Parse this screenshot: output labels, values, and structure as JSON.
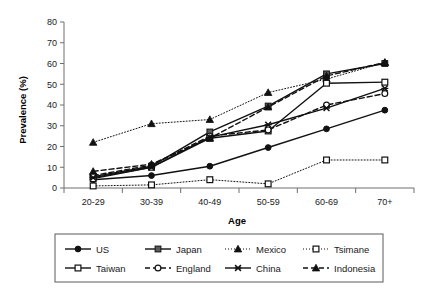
{
  "chart_data": {
    "type": "line",
    "title": "",
    "xlabel": "Age",
    "ylabel": "Prevalence (%)",
    "categories": [
      "20-29",
      "30-39",
      "40-49",
      "50-59",
      "60-69",
      "70+"
    ],
    "ylim": [
      0,
      80
    ],
    "yticks": [
      0,
      10,
      20,
      30,
      40,
      50,
      60,
      70,
      80
    ],
    "grid": false,
    "legend_position": "bottom",
    "series": [
      {
        "name": "US",
        "values": [
          4,
          6,
          10.5,
          19.5,
          28.5,
          37.5
        ],
        "marker": "filled-circle",
        "line": "solid"
      },
      {
        "name": "Japan",
        "values": [
          5.5,
          10.5,
          27,
          39.5,
          55,
          60
        ],
        "marker": "filled-square",
        "line": "solid"
      },
      {
        "name": "Mexico",
        "values": [
          22,
          31,
          33,
          46,
          52.5,
          60.5
        ],
        "marker": "filled-triangle",
        "line": "dotted"
      },
      {
        "name": "Tsimane",
        "values": [
          1,
          1.5,
          4,
          2,
          13.5,
          13.5
        ],
        "marker": "open-square",
        "line": "dotted"
      },
      {
        "name": "Taiwan",
        "values": [
          4.5,
          10,
          24,
          27.5,
          50.5,
          51
        ],
        "marker": "open-square",
        "line": "solid"
      },
      {
        "name": "England",
        "values": [
          6,
          11,
          25,
          28,
          40,
          45.5
        ],
        "marker": "open-circle",
        "line": "dashed"
      },
      {
        "name": "China",
        "values": [
          5,
          10,
          24.5,
          30.5,
          38.5,
          48
        ],
        "marker": "cross-x",
        "line": "solid"
      },
      {
        "name": "Indonesia",
        "values": [
          8,
          11.5,
          24,
          39,
          54,
          60.5
        ],
        "marker": "filled-triangle",
        "line": "dashed"
      }
    ]
  },
  "legend": {
    "entries": [
      {
        "label": "US"
      },
      {
        "label": "Japan"
      },
      {
        "label": "Mexico"
      },
      {
        "label": "Tsimane"
      },
      {
        "label": "Taiwan"
      },
      {
        "label": "England"
      },
      {
        "label": "China"
      },
      {
        "label": "Indonesia"
      }
    ]
  },
  "colors": {
    "line": "#111111",
    "axis": "#6e6e6e",
    "text": "#1a1a1a",
    "japan_marker": "#595959",
    "background": "#ffffff"
  }
}
